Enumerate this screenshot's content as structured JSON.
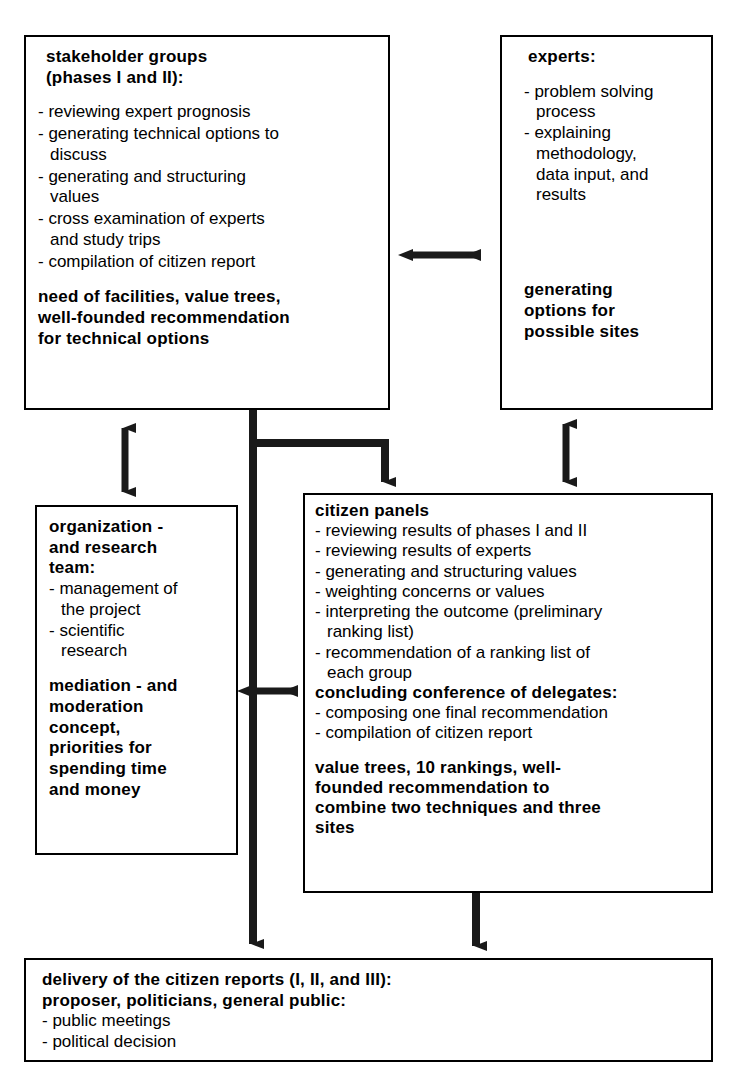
{
  "diagram": {
    "line_color": "#1a1a1a",
    "box_border_color": "#000000",
    "background": "#ffffff"
  },
  "boxes": {
    "stakeholder": {
      "title": "stakeholder groups\n(phases I and II):",
      "items": [
        "- reviewing expert prognosis",
        "- generating technical options to\n  discuss",
        "- generating and structuring\n  values",
        "- cross examination of experts\n  and study trips",
        "- compilation of citizen report"
      ],
      "outcome": "need of  facilities,  value  trees,\nwell-founded  recommendation\nfor  technical  options"
    },
    "experts": {
      "title": "experts:",
      "items": [
        "- problem solving\n  process",
        "- explaining\n  methodology,\n  data input, and\n  results"
      ],
      "outcome": "generating\noptions for\npossible sites"
    },
    "organization": {
      "title": "organization -\nand  research\nteam:",
      "items": [
        "- management of\n  the project",
        "- scientific\n  research"
      ],
      "outcome": "mediation - and\nmoderation\nconcept,\npriorities for\nspending  time\nand money"
    },
    "citizen_panels": {
      "title": "citizen panels",
      "items": [
        "- reviewing results of phases I and II",
        "- reviewing results of experts",
        "- generating and structuring values",
        "- weighting concerns or values",
        "- interpreting the outcome (preliminary\n ranking list)",
        "- recommendation of a ranking list of\n each group"
      ],
      "subtitle": "concluding conference of  delegates:",
      "subitems": [
        "- composing one final recommendation",
        "- compilation of citizen report"
      ],
      "outcome": "value  trees, 10  rankings,  well-\nfounded recommendation to\ncombine two techniques and three\nsites"
    },
    "delivery": {
      "title": "delivery of the citizen reports (I, II, and III):\nproposer, politicians, general public:",
      "items": [
        "- public meetings",
        "- political decision"
      ]
    }
  },
  "connectors": [
    {
      "name": "stakeholder-experts-bidirectional",
      "kind": "double-arrow-horizontal"
    },
    {
      "name": "stakeholder-organization-bidirectional",
      "kind": "double-arrow-vertical"
    },
    {
      "name": "experts-citizen-bidirectional",
      "kind": "double-arrow-vertical"
    },
    {
      "name": "organization-citizen-bidirectional",
      "kind": "double-arrow-horizontal"
    },
    {
      "name": "stakeholder-citizen-branch",
      "kind": "arrow-down"
    },
    {
      "name": "stakeholder-delivery-trunk",
      "kind": "arrow-down"
    },
    {
      "name": "citizen-delivery",
      "kind": "arrow-down"
    }
  ]
}
